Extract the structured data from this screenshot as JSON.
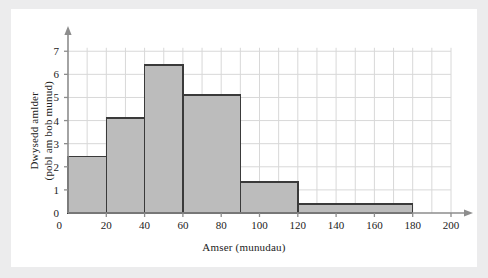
{
  "chart_data": {
    "type": "bar",
    "title": "",
    "subtitle": "",
    "xlabel": "Amser (munudau)",
    "ylabel": "Dwysedd amlder (pobl am bob munud)",
    "ylabel_line1": "Dwysedd amlder",
    "ylabel_line2": "(pobl am bob munud)",
    "xlim": [
      0,
      200
    ],
    "ylim": [
      0,
      7.4
    ],
    "xticks": [
      0,
      20,
      40,
      60,
      80,
      100,
      120,
      140,
      160,
      180,
      200
    ],
    "xticklabels": [
      "0",
      "20",
      "40",
      "60",
      "80",
      "100",
      "120",
      "140",
      "160",
      "180",
      "200"
    ],
    "yticks": [
      0,
      1,
      2,
      3,
      4,
      5,
      6,
      7
    ],
    "yticklabels": [
      "0",
      "1",
      "2",
      "3",
      "4",
      "5",
      "6",
      "7"
    ],
    "grid": true,
    "grid_x_step": 10,
    "grid_y_step": 1,
    "legend": "none",
    "bar_fill": "#bcbcbc",
    "bar_edge": "#3a3a3a",
    "grid_color": "#d8d8d8",
    "axis_color": "#8d8d8d",
    "bins": [
      {
        "x0": 0,
        "x1": 20,
        "height": 2.45
      },
      {
        "x0": 20,
        "x1": 40,
        "height": 4.1
      },
      {
        "x0": 40,
        "x1": 60,
        "height": 6.4
      },
      {
        "x0": 60,
        "x1": 90,
        "height": 5.1
      },
      {
        "x0": 90,
        "x1": 120,
        "height": 1.35
      },
      {
        "x0": 120,
        "x1": 180,
        "height": 0.4
      }
    ],
    "categories": [
      "0-20",
      "20-40",
      "40-60",
      "60-90",
      "90-120",
      "120-180"
    ],
    "values": [
      2.45,
      4.1,
      6.4,
      5.1,
      1.35,
      0.4
    ]
  }
}
